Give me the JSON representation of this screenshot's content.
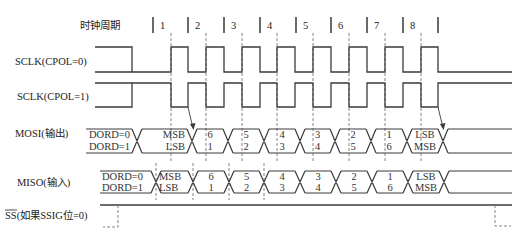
{
  "diagram": {
    "header": {
      "label": "时钟周期",
      "cycles": [
        "1",
        "2",
        "3",
        "4",
        "5",
        "6",
        "7",
        "8"
      ]
    },
    "signals": {
      "sclk_cpol0": {
        "label": "SCLK(CPOL=0)"
      },
      "sclk_cpol1": {
        "label": "SCLK(CPOL=1)"
      },
      "mosi": {
        "label": "MOSI(输出)",
        "segments": [
          {
            "top": "DORD=0",
            "bottom": "DORD=1"
          },
          {
            "top": "MSB",
            "bottom": "LSB"
          },
          {
            "top": "6",
            "bottom": "1"
          },
          {
            "top": "5",
            "bottom": "2"
          },
          {
            "top": "4",
            "bottom": "3"
          },
          {
            "top": "3",
            "bottom": "4"
          },
          {
            "top": "2",
            "bottom": "5"
          },
          {
            "top": "1",
            "bottom": "6"
          },
          {
            "top": "LSB",
            "bottom": "MSB"
          }
        ]
      },
      "miso": {
        "label": "MISO(输入)",
        "segments": [
          {
            "top": "DORD=0",
            "bottom": "DORD=1"
          },
          {
            "top": "MSB",
            "bottom": "LSB"
          },
          {
            "top": "6",
            "bottom": "1"
          },
          {
            "top": "5",
            "bottom": "2"
          },
          {
            "top": "4",
            "bottom": "3"
          },
          {
            "top": "3",
            "bottom": "4"
          },
          {
            "top": "2",
            "bottom": "5"
          },
          {
            "top": "1",
            "bottom": "6"
          },
          {
            "top": "LSB",
            "bottom": "MSB"
          }
        ]
      },
      "ss": {
        "signal": "SS",
        "condition": "(如果SSIG位=0)"
      }
    }
  },
  "colors": {
    "background": "#ffffff",
    "line": "#3a3a3a",
    "text": "#222222",
    "dashed_guide": "#777777"
  }
}
